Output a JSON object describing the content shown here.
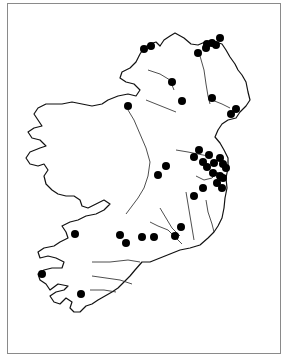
{
  "map": {
    "subject": "Ireland",
    "frame_color": "#8a8a8a",
    "dot_color": "#000000",
    "dot_radius": 4,
    "sites": [
      {
        "x": 144,
        "y": 49
      },
      {
        "x": 151,
        "y": 46
      },
      {
        "x": 207,
        "y": 44
      },
      {
        "x": 212,
        "y": 43
      },
      {
        "x": 216,
        "y": 45
      },
      {
        "x": 220,
        "y": 38
      },
      {
        "x": 206,
        "y": 48
      },
      {
        "x": 198,
        "y": 53
      },
      {
        "x": 172,
        "y": 82
      },
      {
        "x": 182,
        "y": 101
      },
      {
        "x": 212,
        "y": 98
      },
      {
        "x": 236,
        "y": 109
      },
      {
        "x": 231,
        "y": 114
      },
      {
        "x": 128,
        "y": 106
      },
      {
        "x": 199,
        "y": 150
      },
      {
        "x": 194,
        "y": 157
      },
      {
        "x": 209,
        "y": 155
      },
      {
        "x": 203,
        "y": 162
      },
      {
        "x": 207,
        "y": 167
      },
      {
        "x": 214,
        "y": 163
      },
      {
        "x": 220,
        "y": 158
      },
      {
        "x": 223,
        "y": 164
      },
      {
        "x": 226,
        "y": 168
      },
      {
        "x": 213,
        "y": 173
      },
      {
        "x": 220,
        "y": 176
      },
      {
        "x": 223,
        "y": 178
      },
      {
        "x": 217,
        "y": 183
      },
      {
        "x": 222,
        "y": 188
      },
      {
        "x": 194,
        "y": 196
      },
      {
        "x": 203,
        "y": 188
      },
      {
        "x": 166,
        "y": 166
      },
      {
        "x": 158,
        "y": 175
      },
      {
        "x": 75,
        "y": 234
      },
      {
        "x": 120,
        "y": 235
      },
      {
        "x": 126,
        "y": 243
      },
      {
        "x": 142,
        "y": 237
      },
      {
        "x": 154,
        "y": 237
      },
      {
        "x": 175,
        "y": 236
      },
      {
        "x": 181,
        "y": 227
      },
      {
        "x": 42,
        "y": 274
      },
      {
        "x": 81,
        "y": 294
      }
    ]
  }
}
